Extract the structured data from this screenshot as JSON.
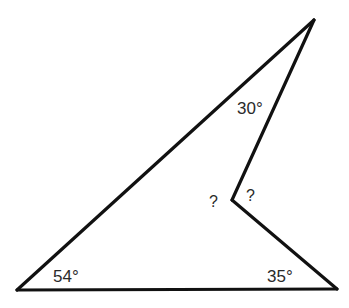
{
  "diagram": {
    "type": "concave quadrilateral (arrowhead) with interior angles",
    "stroke_color": "#111111",
    "label_color": "#2a2a2a",
    "vertices": {
      "top": [
        314,
        20
      ],
      "concave": [
        232,
        200
      ],
      "bottom_right": [
        337,
        289
      ],
      "bottom_left": [
        17,
        290
      ]
    },
    "labels": {
      "top_angle": "30°",
      "bottom_left_angle": "54°",
      "bottom_right_angle": "35°",
      "concave_exterior_unknown": "?",
      "concave_interior_unknown": "?"
    }
  }
}
